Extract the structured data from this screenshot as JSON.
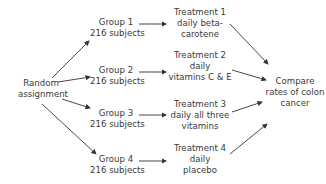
{
  "start": {
    "line1": "Random",
    "line2": "assignment"
  },
  "groups": [
    {
      "name": "Group 1",
      "size": "216 subjects"
    },
    {
      "name": "Group 2",
      "size": "216 subjects"
    },
    {
      "name": "Group 3",
      "size": "216 subjects"
    },
    {
      "name": "Group 4",
      "size": "216 subjects"
    }
  ],
  "treatments": [
    {
      "line1": "Treatment 1",
      "line2": "daily beta-",
      "line3": "carotene"
    },
    {
      "line1": "Treatment 2",
      "line2": "daily",
      "line3": "vitamins C & E"
    },
    {
      "line1": "Treatment 3",
      "line2": "daily all three",
      "line3": "vitamins"
    },
    {
      "line1": "Treatment 4",
      "line2": "daily",
      "line3": "placebo"
    }
  ],
  "outcome": {
    "line1": "Compare",
    "line2": "rates of colon",
    "line3": "cancer"
  },
  "colors": {
    "text": "#3a3a3a",
    "arrow": "#333333"
  }
}
